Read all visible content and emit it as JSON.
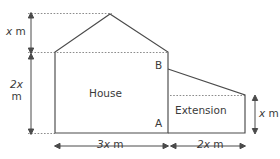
{
  "figure": {
    "shapes": {
      "house_label": "House",
      "extension_label": "Extension"
    },
    "points": {
      "a": "A",
      "b": "B"
    },
    "dimensions": {
      "roof_height": {
        "value": "x",
        "unit": "m",
        "position": "left-top"
      },
      "wall_height": {
        "value": "2x",
        "unit": "m",
        "position": "left-bottom"
      },
      "house_width": {
        "value": "3x",
        "unit": "m",
        "position": "bottom-left"
      },
      "extension_width": {
        "value": "2x",
        "unit": "m",
        "position": "bottom-right"
      },
      "extension_height": {
        "value": "x",
        "unit": "m",
        "position": "right"
      }
    },
    "colors": {
      "outline": "#4a4a4a",
      "guide": "#8c8c8c",
      "text": "#3a3a3a",
      "background": "#ffffff"
    },
    "geometry": {
      "apex": [
        110,
        14
      ],
      "eaves_left": [
        55,
        52
      ],
      "eaves_right": [
        168,
        52
      ],
      "base_left": [
        55,
        133
      ],
      "house_right_base": [
        168,
        133
      ],
      "extension_top_right": [
        245,
        95
      ],
      "extension_base_right": [
        245,
        133
      ],
      "point_b": [
        168,
        69
      ]
    }
  }
}
